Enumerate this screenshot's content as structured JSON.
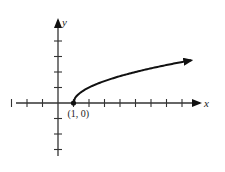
{
  "chart_data": {
    "type": "line",
    "title": "",
    "function": "y = sqrt(x - 1)",
    "xlabel": "x",
    "ylabel": "y",
    "xlim": [
      -3,
      9
    ],
    "ylim": [
      -4,
      5
    ],
    "x_ticks": [
      -3,
      -2,
      -1,
      1,
      2,
      3,
      4,
      5,
      6,
      7,
      8
    ],
    "y_ticks": [
      -3,
      -2,
      -1,
      1,
      2,
      3,
      4
    ],
    "grid": false,
    "series": [
      {
        "name": "sqrt(x-1)",
        "x_start": 1,
        "x_end": 8.6,
        "arrow_at_end": true
      }
    ],
    "annotations": [
      {
        "text": "(1, 0)",
        "x": 1,
        "y": 0,
        "marker": "filled-dot"
      }
    ],
    "colors": {
      "axis": "#333333",
      "curve": "#111111"
    }
  }
}
